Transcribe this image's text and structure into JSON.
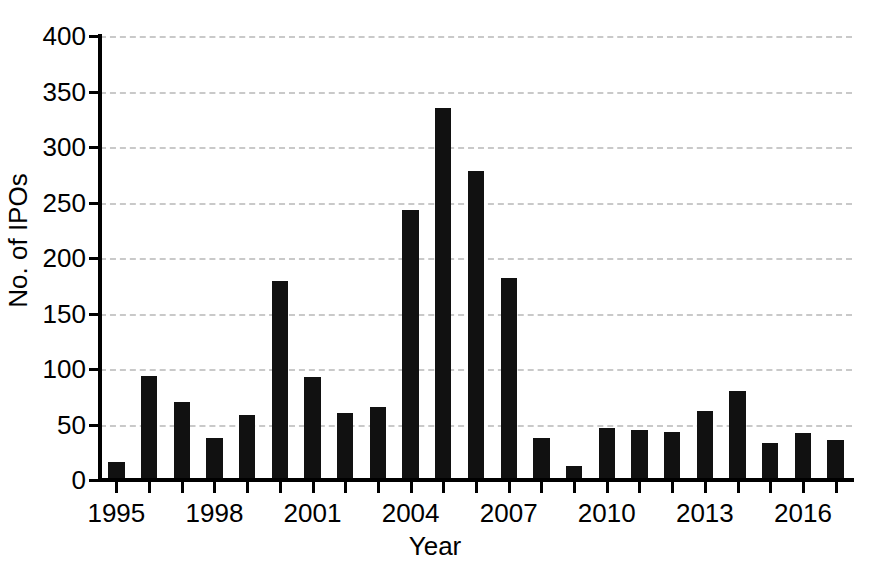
{
  "chart_data": {
    "type": "bar",
    "title": "",
    "xlabel": "Year",
    "ylabel": "No. of IPOs",
    "categories": [
      "1995",
      "1996",
      "1997",
      "1998",
      "1999",
      "2000",
      "2001",
      "2002",
      "2003",
      "2004",
      "2005",
      "2006",
      "2007",
      "2008",
      "2009",
      "2010",
      "2011",
      "2012",
      "2013",
      "2014",
      "2015",
      "2016",
      "2017"
    ],
    "values": [
      16,
      94,
      70,
      38,
      59,
      179,
      93,
      60,
      66,
      243,
      335,
      278,
      182,
      38,
      13,
      47,
      45,
      43,
      62,
      80,
      33,
      42,
      36
    ],
    "ylim": [
      0,
      400
    ],
    "yticks": [
      0,
      50,
      100,
      150,
      200,
      250,
      300,
      350,
      400
    ],
    "ytick_labels": [
      "0",
      "50",
      "100",
      "150",
      "200",
      "250",
      "300",
      "350",
      "400"
    ],
    "xtick_labels": [
      "1995",
      "1998",
      "2001",
      "2004",
      "2007",
      "2010",
      "2013",
      "2016"
    ],
    "xtick_categories": [
      "1995",
      "1998",
      "2001",
      "2004",
      "2007",
      "2010",
      "2013",
      "2016"
    ],
    "grid": "horizontal-dashed",
    "legend": "none",
    "bar_color": "#111111",
    "grid_color": "#c9c9c9",
    "axis_color": "#000000",
    "background": "#ffffff"
  }
}
